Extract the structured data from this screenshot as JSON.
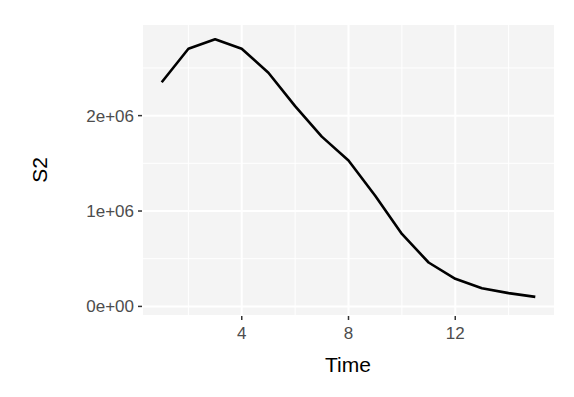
{
  "chart_data": {
    "type": "line",
    "title": "",
    "xlabel": "Time",
    "ylabel": "S2",
    "x": [
      1,
      2,
      3,
      4,
      5,
      6,
      7,
      8,
      9,
      10,
      11,
      12,
      13,
      14,
      15
    ],
    "series": [
      {
        "name": "S2",
        "values": [
          2350000,
          2700000,
          2800000,
          2700000,
          2450000,
          2100000,
          1780000,
          1530000,
          1160000,
          760000,
          460000,
          290000,
          190000,
          140000,
          100000
        ]
      }
    ],
    "x_ticks": [
      4,
      8,
      12
    ],
    "x_tick_labels": [
      "4",
      "8",
      "12"
    ],
    "y_ticks": [
      0,
      1000000,
      2000000
    ],
    "y_tick_labels": [
      "0e+00",
      "1e+06",
      "2e+06"
    ],
    "xlim": [
      0.3,
      15.7
    ],
    "ylim": [
      -90000,
      2950000
    ],
    "grid": true,
    "legend": "none",
    "colors": {
      "line": "#000000",
      "panel_background": "#f4f4f4",
      "grid": "#ffffff",
      "tick_label": "#4d4d4d"
    }
  }
}
